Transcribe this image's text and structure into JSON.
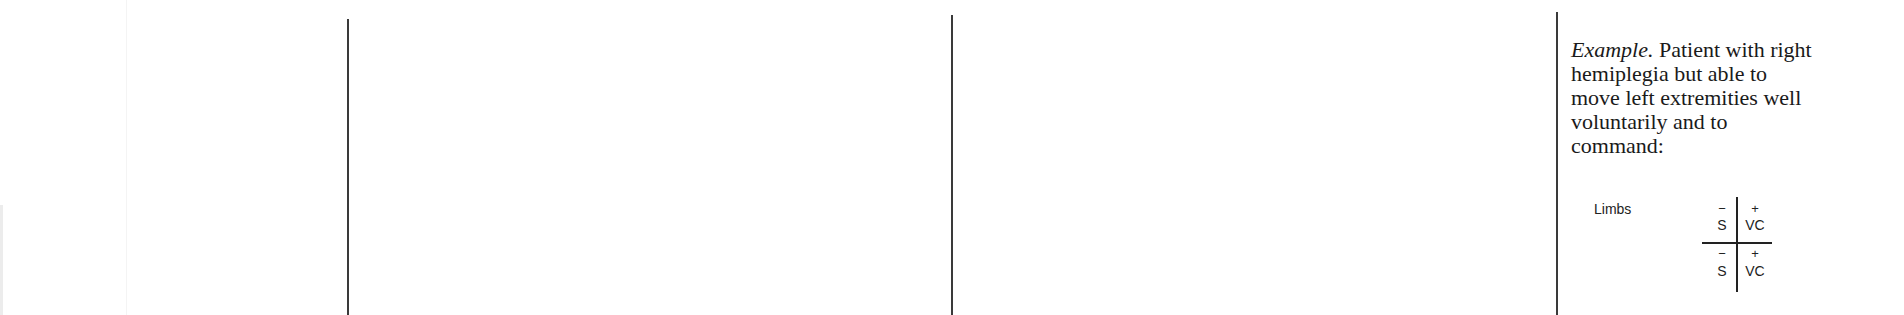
{
  "example": {
    "lead": "Example.",
    "lines": [
      " Patient with right",
      "hemiplegia but able to",
      "move left extremities well",
      "voluntarily and to",
      "command:"
    ]
  },
  "diagram": {
    "row_label": "Limbs",
    "quadrants": {
      "top_left": {
        "sign": "−",
        "value": "S"
      },
      "top_right": {
        "sign": "+",
        "value": "VC"
      },
      "bottom_left": {
        "sign": "−",
        "value": "S"
      },
      "bottom_right": {
        "sign": "+",
        "value": "VC"
      }
    }
  }
}
